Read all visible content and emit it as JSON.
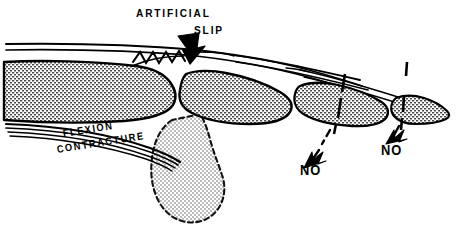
{
  "figure": {
    "background_color": "#ffffff",
    "ink_color": "#000000",
    "bone_fill_color": "#c9c9c9",
    "ghost_fill_color": "#d8d8d8",
    "width": 457,
    "height": 239
  },
  "labels": {
    "artificial": "ARTIFICIAL",
    "slip": "SLIP",
    "flexion": "FLEXION",
    "contracture": "CONTRACTURE",
    "no_left": "NO",
    "no_right": "NO"
  },
  "annotations": {
    "artificial_slip_arrow": "down-arrow-icon",
    "no_left_arrow": "down-left-arrow-icon",
    "no_right_arrow": "down-left-arrow-icon",
    "mcp_suture": "zigzag-suture-icon",
    "pip_dashed_axis": "dashed-joint-axis-icon",
    "dip_dashed_axis": "dashed-joint-axis-icon",
    "flexed_finger_ghost": "dashed-outline-ghost-icon",
    "extensor_tendon_bands": "tendon-lines-icon",
    "flexor_tendon_bands": "tendon-lines-icon"
  },
  "structures": [
    {
      "id": "metacarpal",
      "name": "metacarpal-bone"
    },
    {
      "id": "proximal-phalanx",
      "name": "proximal-phalanx-bone"
    },
    {
      "id": "middle-phalanx",
      "name": "middle-phalanx-bone"
    },
    {
      "id": "distal-phalanx",
      "name": "distal-phalanx-bone"
    },
    {
      "id": "ghost-finger",
      "name": "flexed-finger-ghost-outline"
    }
  ]
}
